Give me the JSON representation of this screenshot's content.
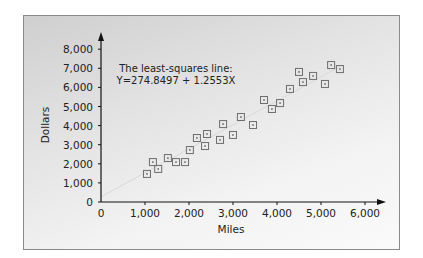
{
  "chart_data": {
    "type": "scatter",
    "title": "",
    "xlabel": "Miles",
    "ylabel": "Dollars",
    "xlim": [
      0,
      6000
    ],
    "ylim": [
      0,
      8000
    ],
    "x_ticks": [
      "0",
      "1,000",
      "2,000",
      "3,000",
      "4,000",
      "5,000",
      "6,000"
    ],
    "y_ticks": [
      "0",
      "1,000",
      "2,000",
      "3,000",
      "4,000",
      "5,000",
      "6,000",
      "7,000",
      "8,000"
    ],
    "grid": false,
    "legend": null,
    "annotation": {
      "line1": "The least-squares line:",
      "line2": "Y=274.8497 + 1.2553X"
    },
    "regression_line": {
      "intercept": 274.8497,
      "slope": 1.2553,
      "x_range": [
        0,
        5500
      ]
    },
    "series": [
      {
        "name": "Observations",
        "marker": "square-with-dot",
        "points": [
          [
            1045,
            1470
          ],
          [
            1180,
            2090
          ],
          [
            1300,
            1730
          ],
          [
            1520,
            2300
          ],
          [
            1705,
            2090
          ],
          [
            1910,
            2090
          ],
          [
            2020,
            2720
          ],
          [
            2180,
            3350
          ],
          [
            2365,
            2930
          ],
          [
            2410,
            3560
          ],
          [
            2705,
            3250
          ],
          [
            2775,
            4080
          ],
          [
            3000,
            3510
          ],
          [
            3180,
            4450
          ],
          [
            3455,
            4030
          ],
          [
            3705,
            5340
          ],
          [
            3885,
            4870
          ],
          [
            4070,
            5180
          ],
          [
            4295,
            5920
          ],
          [
            4500,
            6810
          ],
          [
            4590,
            6280
          ],
          [
            4820,
            6600
          ],
          [
            5090,
            6180
          ],
          [
            5230,
            7170
          ],
          [
            5430,
            6960
          ]
        ]
      }
    ]
  },
  "colors": {
    "axis": "#111111",
    "marker": "#6e6e6e",
    "regression": "#d9d9d9",
    "frame_border": "#8a8a8a"
  }
}
